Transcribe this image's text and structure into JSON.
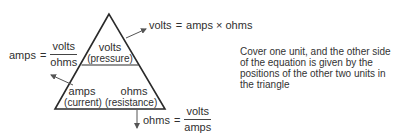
{
  "diagram": {
    "type": "ohms-law-triangle",
    "colors": {
      "line": "#2a2a2a",
      "arrow": "#555555",
      "text": "#2f2f2f"
    },
    "triangle": {
      "top": {
        "unit": "volts",
        "quantity": "(pressure)"
      },
      "bottom_left": {
        "unit": "amps",
        "quantity": "(current)"
      },
      "bottom_right": {
        "unit": "ohms",
        "quantity": "(resistance)"
      }
    },
    "equations": {
      "volts": {
        "lhs": "volts",
        "eq": "=",
        "rhs": "amps × ohms"
      },
      "amps": {
        "lhs": "amps",
        "eq": "=",
        "numerator": "volts",
        "denominator": "ohms"
      },
      "ohms": {
        "lhs": "ohms",
        "eq": "=",
        "numerator": "volts",
        "denominator": "amps"
      }
    },
    "note": "Cover one unit, and the other side of the equation is given by the positions of the other two units in the triangle"
  }
}
